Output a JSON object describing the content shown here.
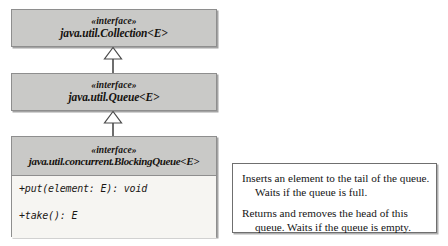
{
  "diagram": {
    "type": "uml-class-diagram",
    "classes": [
      {
        "id": "collection",
        "stereotype": "«interface»",
        "name": "java.util.Collection<E>",
        "members": []
      },
      {
        "id": "queue",
        "stereotype": "«interface»",
        "name": "java.util.Queue<E>",
        "members": []
      },
      {
        "id": "blockingqueue",
        "stereotype": "«interface»",
        "name": "java.util.concurrent.BlockingQueue<E>",
        "members": [
          "+put(element: E): void",
          "+take(): E"
        ]
      }
    ],
    "relationships": [
      {
        "kind": "generalization",
        "from": "queue",
        "to": "collection"
      },
      {
        "kind": "generalization",
        "from": "blockingqueue",
        "to": "queue"
      }
    ],
    "note": {
      "paragraphs": [
        "Inserts an element to the tail of the queue.\nWaits if the queue is full.",
        "Returns and removes the head of this\nqueue. Waits if the queue is empty."
      ]
    },
    "colors": {
      "header_fill": "#c9c9c7",
      "member_fill": "#f6f5f2",
      "border": "#8e8e8e",
      "note_border": "#6f6f6f",
      "text": "#15120f",
      "background": "#ffffff"
    }
  }
}
